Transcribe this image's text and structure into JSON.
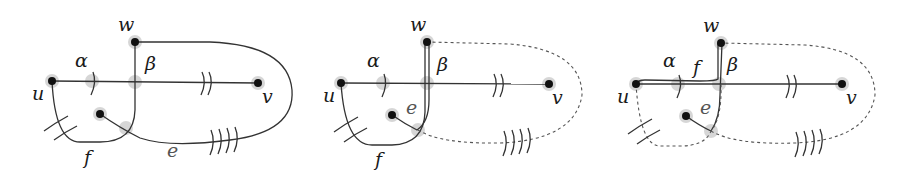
{
  "figure": {
    "panels": [
      {
        "id": "panel-1",
        "labels": {
          "w": "w",
          "u": "u",
          "v": "v",
          "alpha": "α",
          "beta": "β",
          "f": "f",
          "e": "e"
        }
      },
      {
        "id": "panel-2",
        "labels": {
          "w": "w",
          "u": "u",
          "v": "v",
          "alpha": "α",
          "beta": "β",
          "f": "f",
          "e": "e"
        }
      },
      {
        "id": "panel-3",
        "labels": {
          "w": "w",
          "u": "u",
          "v": "v",
          "alpha": "α",
          "beta": "β",
          "f": "f",
          "e": "e"
        }
      }
    ],
    "colors": {
      "node": "#111111",
      "halo": "#c8c8c8",
      "edge": "#333333",
      "dashed_edge": "#555555"
    }
  }
}
